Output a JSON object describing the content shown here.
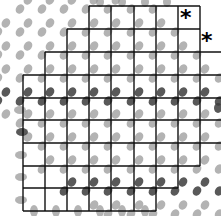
{
  "diagram": {
    "width": 221,
    "height": 216,
    "colors": {
      "background": "#ffffff",
      "grid_line": "#111111",
      "dot_light": "#9a9a9a",
      "dot_dark": "#3c3c3c",
      "marker": "#000000"
    },
    "grid": {
      "vertical_x": [
        23,
        45,
        67,
        89,
        111,
        134,
        156,
        178,
        200
      ],
      "horizontal_y": [
        6,
        29,
        52,
        75,
        98,
        120,
        143,
        166,
        188,
        211
      ],
      "horizontal_segments": [
        {
          "y": 6,
          "x1": 89,
          "x2": 200
        },
        {
          "y": 29,
          "x1": 67,
          "x2": 200
        },
        {
          "y": 52,
          "x1": 45,
          "x2": 221
        },
        {
          "y": 75,
          "x1": 23,
          "x2": 221
        },
        {
          "y": 98,
          "x1": 23,
          "x2": 221
        },
        {
          "y": 120,
          "x1": 23,
          "x2": 221
        },
        {
          "y": 143,
          "x1": 23,
          "x2": 221
        },
        {
          "y": 166,
          "x1": 23,
          "x2": 200
        },
        {
          "y": 188,
          "x1": 23,
          "x2": 178
        },
        {
          "y": 211,
          "x1": 23,
          "x2": 156
        }
      ],
      "vertical_segments": [
        {
          "x": 23,
          "y1": 75,
          "y2": 211
        },
        {
          "x": 45,
          "y1": 52,
          "y2": 211
        },
        {
          "x": 67,
          "y1": 29,
          "y2": 211
        },
        {
          "x": 89,
          "y1": 6,
          "y2": 211
        },
        {
          "x": 111,
          "y1": 6,
          "y2": 211
        },
        {
          "x": 134,
          "y1": 6,
          "y2": 211
        },
        {
          "x": 156,
          "y1": 6,
          "y2": 211
        },
        {
          "x": 178,
          "y1": 6,
          "y2": 188
        },
        {
          "x": 200,
          "y1": 6,
          "y2": 166
        }
      ]
    },
    "dot_lattice": {
      "offsets": [
        [
          -3,
          3
        ],
        [
          5,
          -6
        ]
      ],
      "rx": 4,
      "ry": 5,
      "rotation": 35,
      "dark_rows_y": [
        98,
        188
      ],
      "region": {
        "cx": 118,
        "cy": 108,
        "a": 150,
        "b": 100,
        "angle": -45
      }
    },
    "halo_dots": [
      {
        "x": 22,
        "y": 132,
        "rx": 6,
        "ry": 4,
        "rot": 0,
        "dark": true
      },
      {
        "x": 21,
        "y": 155,
        "rx": 6,
        "ry": 4,
        "rot": 0,
        "dark": false
      },
      {
        "x": 21,
        "y": 177,
        "rx": 6,
        "ry": 4,
        "rot": 0,
        "dark": false
      },
      {
        "x": 21,
        "y": 200,
        "rx": 6,
        "ry": 4,
        "rot": 0,
        "dark": false
      },
      {
        "x": 20,
        "y": 110,
        "rx": 6,
        "ry": 4,
        "rot": 0,
        "dark": false
      },
      {
        "x": 34,
        "y": 211,
        "rx": 4,
        "ry": 6,
        "rot": 0,
        "dark": false
      },
      {
        "x": 56,
        "y": 211,
        "rx": 4,
        "ry": 6,
        "rot": 0,
        "dark": false
      },
      {
        "x": 78,
        "y": 211,
        "rx": 4,
        "ry": 6,
        "rot": 0,
        "dark": false
      },
      {
        "x": 100,
        "y": 211,
        "rx": 4,
        "ry": 6,
        "rot": 0,
        "dark": false
      },
      {
        "x": 122,
        "y": 211,
        "rx": 4,
        "ry": 6,
        "rot": 0,
        "dark": false
      },
      {
        "x": 145,
        "y": 211,
        "rx": 4,
        "ry": 6,
        "rot": 0,
        "dark": false
      },
      {
        "x": 218,
        "y": 108,
        "rx": 4,
        "ry": 5,
        "rot": 0,
        "dark": true
      },
      {
        "x": 100,
        "y": 2,
        "rx": 4,
        "ry": 5,
        "rot": 0,
        "dark": false
      },
      {
        "x": 122,
        "y": 2,
        "rx": 4,
        "ry": 5,
        "rot": 0,
        "dark": false
      },
      {
        "x": 145,
        "y": 2,
        "rx": 4,
        "ry": 5,
        "rot": 0,
        "dark": false
      },
      {
        "x": 167,
        "y": 2,
        "rx": 4,
        "ry": 5,
        "rot": 0,
        "dark": false
      }
    ],
    "markers": [
      {
        "symbol": "*",
        "x": 180,
        "y": 7
      },
      {
        "symbol": "*",
        "x": 201,
        "y": 30
      }
    ]
  }
}
